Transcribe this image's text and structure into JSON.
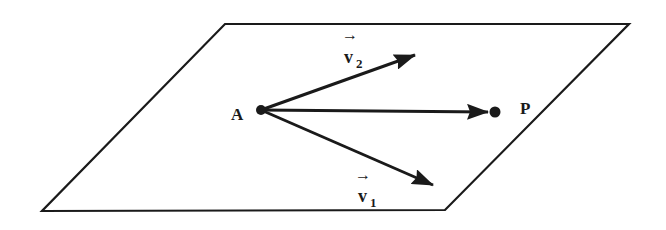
{
  "diagram": {
    "type": "plane-with-vectors",
    "colors": {
      "ink": "#1a1a1a",
      "background": "#ffffff"
    },
    "plane": {
      "shape": "parallelogram",
      "corners": [
        [
          225,
          24
        ],
        [
          629,
          24
        ],
        [
          445,
          210
        ],
        [
          42,
          211
        ]
      ]
    },
    "points": [
      {
        "id": "A",
        "label": "A",
        "x": 261,
        "y": 110
      },
      {
        "id": "P",
        "label": "P",
        "x": 495,
        "y": 112
      }
    ],
    "vectors": [
      {
        "id": "v2",
        "label": "v",
        "subscript": "2",
        "arrow_over": "→",
        "from": "A",
        "tip": [
          415,
          55
        ]
      },
      {
        "id": "AP",
        "label": "",
        "from": "A",
        "tip": [
          495,
          112
        ]
      },
      {
        "id": "v1",
        "label": "v",
        "subscript": "1",
        "arrow_over": "→",
        "from": "A",
        "tip": [
          433,
          185
        ]
      }
    ]
  },
  "labels": {
    "A": "A",
    "P": "P",
    "v1_base": "v",
    "v1_sub": "1",
    "v1_arrow": "→",
    "v2_base": "v",
    "v2_sub": "2",
    "v2_arrow": "→"
  }
}
